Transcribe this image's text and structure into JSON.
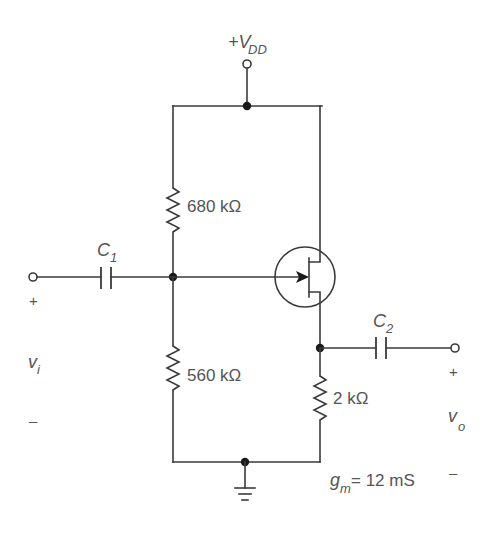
{
  "diagram": {
    "type": "circuit-schematic",
    "supply": {
      "label_main": "+V",
      "label_sub": "DD"
    },
    "components": {
      "r1": {
        "label": "680 kΩ"
      },
      "r2": {
        "label": "560 kΩ"
      },
      "rs": {
        "label": "2 kΩ"
      },
      "c1": {
        "label_main": "C",
        "label_sub": "1"
      },
      "c2": {
        "label_main": "C",
        "label_sub": "2"
      },
      "transistor": {
        "type": "n-channel JFET"
      }
    },
    "input": {
      "label_main": "v",
      "label_sub": "i",
      "plus": "+",
      "minus": "–"
    },
    "output": {
      "label_main": "v",
      "label_sub": "o",
      "plus": "+",
      "minus": "–"
    },
    "parameter": {
      "label_main": "g",
      "label_sub": "m",
      "value": " = 12 mS"
    },
    "colors": {
      "wire": "#3a3a3a",
      "text": "#555555",
      "node": "#1a1a1a"
    }
  }
}
